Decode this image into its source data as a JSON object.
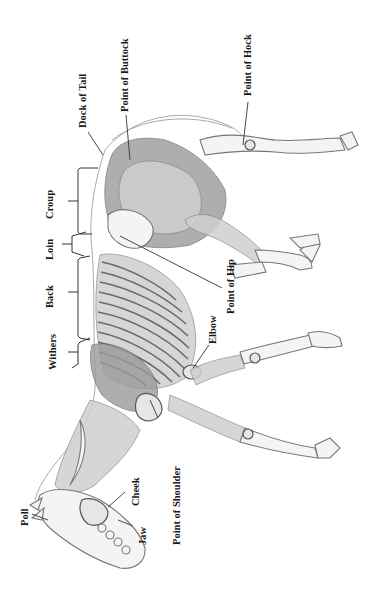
{
  "diagram": {
    "labels": {
      "dock_of_tail": "Dock of Tail",
      "point_of_buttock": "Point of Buttock",
      "point_of_hock": "Point of Hock",
      "croup": "Croup",
      "loin": "Loin",
      "back": "Back",
      "withers": "Withers",
      "point_of_hip": "Point of Hip",
      "elbow": "Elbow",
      "point_of_shoulder": "Point of Shoulder",
      "cheek": "Cheek",
      "poll": "Poll",
      "jaw": "Jaw"
    }
  }
}
